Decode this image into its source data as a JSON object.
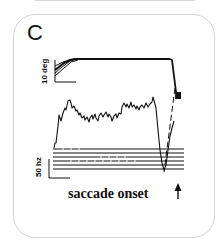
{
  "figure": {
    "panel_letter": "C",
    "eye_position_scale_label": "10 deg",
    "firing_rate_scale_label": "50 hz",
    "alignment_label": "saccade onset",
    "alignment_marker": "up-arrow-icon",
    "colors": {
      "ink": "#111111",
      "card_border": "#d4d4d4",
      "background": "#ffffff"
    }
  }
}
